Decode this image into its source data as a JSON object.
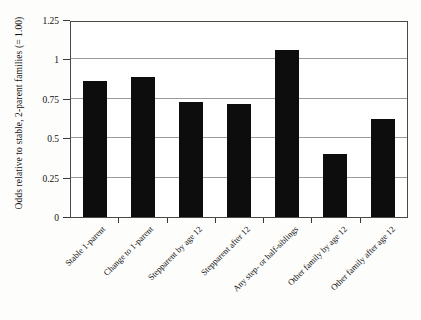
{
  "top_sliver_text": "",
  "chart_data": {
    "type": "bar",
    "title": "",
    "subtitle": "",
    "xlabel": "",
    "ylabel": "Odds relative to stable, 2-parent families (= 1.00)",
    "categories": [
      "Stable 1-parent",
      "Change  to 1-parent",
      "Stepparent by age 12",
      "Stepparent after 12",
      "Any step- or half-siblings",
      "Other family by age 12",
      "Other family after age 12"
    ],
    "values": [
      0.86,
      0.89,
      0.73,
      0.72,
      1.06,
      0.4,
      0.62
    ],
    "ylim": [
      0,
      1.25
    ],
    "yticks": [
      0,
      0.25,
      0.5,
      0.75,
      1,
      1.25
    ],
    "ytick_labels": [
      "0",
      "0.25",
      "0.5",
      "0.75",
      "1",
      "1.25"
    ],
    "grid": true,
    "legend": false,
    "legend_position": "none",
    "bar_color": "#0d0d0d",
    "gridline_color": "#9a9a9a",
    "plot_background": "#ffffff",
    "axis_color": "#4a4a4a"
  }
}
